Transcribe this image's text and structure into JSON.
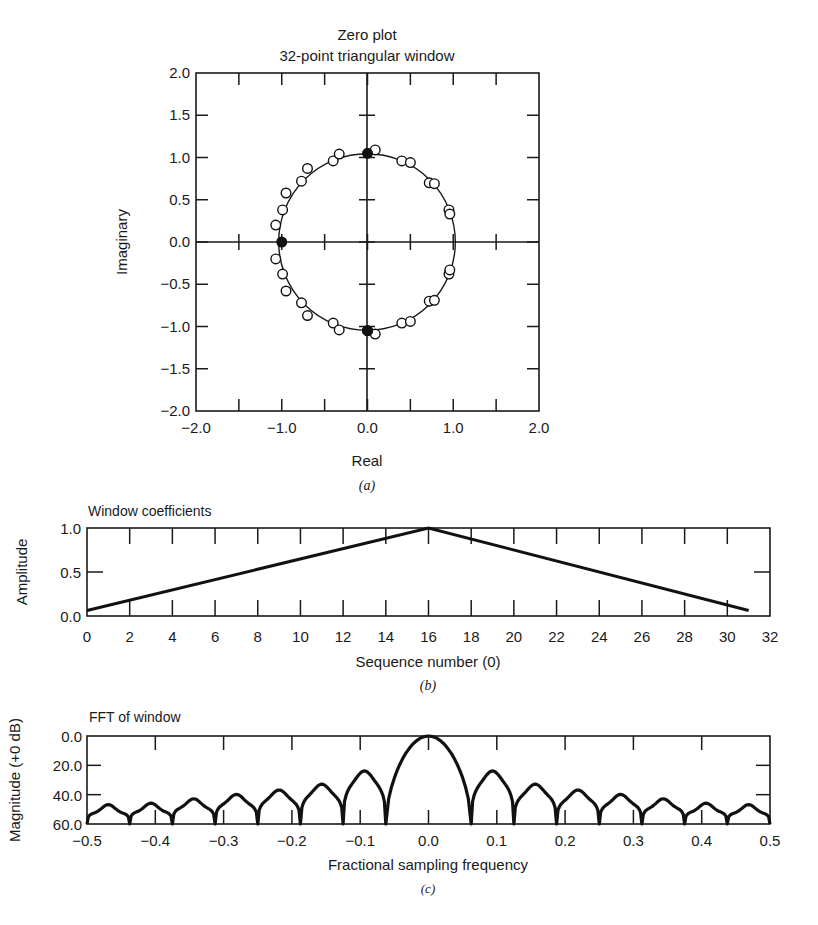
{
  "chart_data": [
    {
      "id": "a",
      "type": "scatter",
      "title": "Zero plot",
      "subtitle": "32-point triangular window",
      "xlabel": "Real",
      "ylabel": "Imaginary",
      "caption": "(a)",
      "xlim": [
        -2.0,
        2.0
      ],
      "ylim": [
        -2.0,
        2.0
      ],
      "xticks": [
        "-2.0",
        "-1.0",
        "0.0",
        "1.0",
        "2.0"
      ],
      "yticks": [
        "2.0",
        "1.5",
        "1.0",
        "0.5",
        "0.0",
        "-0.5",
        "-1.0",
        "-1.5",
        "-2.0"
      ],
      "grid": false,
      "unit_circle_radius": 1.03,
      "series": [
        {
          "name": "zeros (open)",
          "marker": "open-circle",
          "points": [
            [
              -1.07,
              0.2
            ],
            [
              -0.99,
              0.38
            ],
            [
              -0.95,
              0.58
            ],
            [
              -0.77,
              0.72
            ],
            [
              -0.7,
              0.87
            ],
            [
              -0.4,
              0.96
            ],
            [
              -0.33,
              1.04
            ],
            [
              0.09,
              1.09
            ],
            [
              0.4,
              0.96
            ],
            [
              0.5,
              0.94
            ],
            [
              0.72,
              0.7
            ],
            [
              0.78,
              0.69
            ],
            [
              0.95,
              0.38
            ],
            [
              0.96,
              0.33
            ],
            [
              -1.07,
              -0.2
            ],
            [
              -0.99,
              -0.38
            ],
            [
              -0.95,
              -0.58
            ],
            [
              -0.77,
              -0.72
            ],
            [
              -0.7,
              -0.87
            ],
            [
              -0.4,
              -0.96
            ],
            [
              -0.33,
              -1.04
            ],
            [
              0.09,
              -1.09
            ],
            [
              0.4,
              -0.96
            ],
            [
              0.5,
              -0.94
            ],
            [
              0.72,
              -0.7
            ],
            [
              0.78,
              -0.69
            ],
            [
              0.95,
              -0.38
            ],
            [
              0.96,
              -0.33
            ],
            [
              0.0,
              -1.05
            ]
          ]
        },
        {
          "name": "zeros (filled)",
          "marker": "filled-circle",
          "points": [
            [
              -1.0,
              0.0
            ],
            [
              0.0,
              1.05
            ],
            [
              0.0,
              -1.05
            ]
          ]
        }
      ]
    },
    {
      "id": "b",
      "type": "line",
      "title": "Window coefficients",
      "xlabel": "Sequence number (0)",
      "ylabel": "Amplitude",
      "caption": "(b)",
      "xlim": [
        0,
        32
      ],
      "ylim": [
        0.0,
        1.0
      ],
      "xticks": [
        "0",
        "2",
        "4",
        "6",
        "8",
        "10",
        "12",
        "14",
        "16",
        "18",
        "20",
        "22",
        "24",
        "26",
        "28",
        "30",
        "32"
      ],
      "yticks": [
        "1.0",
        "0.5",
        "0.0"
      ],
      "grid": false,
      "x": [
        0,
        16,
        31
      ],
      "values": [
        0.0625,
        1.0,
        0.0625
      ]
    },
    {
      "id": "c",
      "type": "line",
      "title": "FFT of window",
      "xlabel": "Fractional sampling frequency",
      "ylabel": "Magnitude (+0 dB)",
      "caption": "(c)",
      "xlim": [
        -0.5,
        0.5
      ],
      "ylim": [
        60.0,
        0.0
      ],
      "xticks": [
        "-0.5",
        "-0.4",
        "-0.3",
        "-0.2",
        "-0.1",
        "0.0",
        "0.1",
        "0.2",
        "0.3",
        "0.4",
        "0.5"
      ],
      "yticks": [
        "0.0",
        "20.0",
        "40.0",
        "60.0"
      ],
      "grid": false,
      "y_axis_inverted": true,
      "nulls": [
        -0.5,
        -0.4375,
        -0.375,
        -0.3125,
        -0.25,
        -0.1875,
        -0.125,
        -0.0625,
        0.0625,
        0.125,
        0.1875,
        0.25,
        0.3125,
        0.375,
        0.4375,
        0.5
      ],
      "lobes": [
        {
          "center": -0.47,
          "peak_db": 49
        },
        {
          "center": -0.405,
          "peak_db": 48
        },
        {
          "center": -0.34,
          "peak_db": 45
        },
        {
          "center": -0.275,
          "peak_db": 42
        },
        {
          "center": -0.215,
          "peak_db": 39
        },
        {
          "center": -0.155,
          "peak_db": 35
        },
        {
          "center": -0.093,
          "peak_db": 26
        },
        {
          "center": 0.0,
          "peak_db": 0
        },
        {
          "center": 0.093,
          "peak_db": 26
        },
        {
          "center": 0.155,
          "peak_db": 35
        },
        {
          "center": 0.215,
          "peak_db": 39
        },
        {
          "center": 0.275,
          "peak_db": 42
        },
        {
          "center": 0.34,
          "peak_db": 45
        },
        {
          "center": 0.405,
          "peak_db": 48
        },
        {
          "center": 0.47,
          "peak_db": 49
        }
      ]
    }
  ]
}
